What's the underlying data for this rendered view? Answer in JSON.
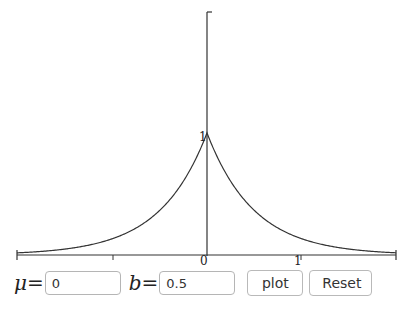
{
  "chart_data": {
    "type": "line",
    "title": "",
    "xlabel": "",
    "ylabel": "",
    "xlim": [
      -2,
      2
    ],
    "ylim": [
      0,
      2
    ],
    "grid": false,
    "legend": null,
    "x_ticks": [
      -1,
      0,
      1
    ],
    "x_tick_labels": [
      "",
      "0",
      "1"
    ],
    "y_tick_labels": [
      "1"
    ],
    "series": [
      {
        "name": "Laplace density (mu=0, b=0.5)",
        "function": "1/(2b) * exp(-|x-mu|/b)",
        "x": [
          -2,
          -1.5,
          -1,
          -0.75,
          -0.5,
          -0.25,
          0,
          0.25,
          0.5,
          0.75,
          1,
          1.5,
          2
        ],
        "values": [
          0.018,
          0.05,
          0.135,
          0.223,
          0.368,
          0.607,
          1.0,
          0.607,
          0.368,
          0.223,
          0.135,
          0.05,
          0.018
        ]
      }
    ],
    "color": "#333333"
  },
  "axis_labels": {
    "origin": "0",
    "x_one": "1",
    "peak": "1"
  },
  "controls": {
    "mu_label": "μ",
    "b_label": "b",
    "equals": "=",
    "mu_value": "0",
    "b_value": "0.5",
    "plot_label": "plot",
    "reset_label": "Reset"
  }
}
